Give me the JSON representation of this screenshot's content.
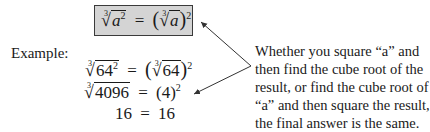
{
  "rule": {
    "radical_index": "3",
    "variable": "a",
    "exponent": "2",
    "equals": "="
  },
  "example": {
    "label": "Example:",
    "lines": [
      {
        "left_radicand": "64",
        "left_exp": "2",
        "right_radicand": "64",
        "right_exp": "2"
      },
      {
        "left_radicand": "4096",
        "right_base": "(4)",
        "right_exp": "2"
      },
      {
        "left": "16",
        "right": "16"
      }
    ]
  },
  "explanation": {
    "lines": [
      "Whether you square “a” and",
      "then find the cube root of the",
      "result, or find the cube root of",
      "“a” and then square the result,",
      "the final answer is the same."
    ]
  },
  "colors": {
    "box_fill": "#d4d4d4",
    "box_border": "#3a3a3a",
    "arrow": "#333333",
    "text": "#1a1a1a"
  }
}
